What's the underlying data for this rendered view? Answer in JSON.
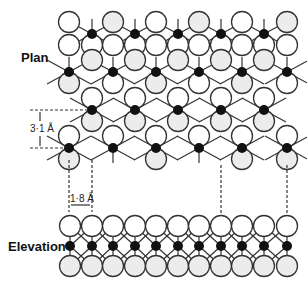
{
  "labels": {
    "plan": "Plan",
    "elevation": "Elevation",
    "vertical_dimension": "3·1 Å",
    "horizontal_dimension": "1·8 Å"
  },
  "colors": {
    "metal_atom": "#111111",
    "atom_light": "#ffffff",
    "atom_shaded": "#ececec",
    "bond": "#333333"
  },
  "plan": {
    "metal_rows_y": [
      34,
      72,
      110,
      148
    ],
    "row_a_x": [
      92,
      135,
      178,
      221,
      264
    ],
    "row_b_x": [
      69,
      113,
      156,
      199,
      242,
      287
    ]
  },
  "elevation": {
    "metal_y": 246,
    "top_y": 226,
    "bottom_y": 266,
    "x": [
      70,
      92,
      113,
      135,
      156,
      178,
      199,
      221,
      242,
      264,
      287
    ]
  }
}
